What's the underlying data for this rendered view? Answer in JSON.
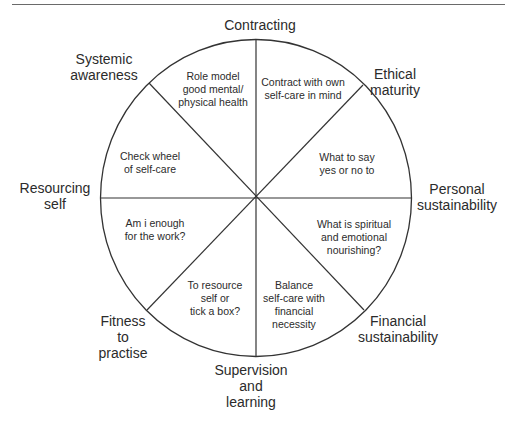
{
  "diagram": {
    "type": "wheel",
    "segment_count": 8,
    "stroke_color": "#333333",
    "background_color": "#ffffff",
    "outer_labels": {
      "contracting": [
        "Contracting"
      ],
      "ethical_maturity": [
        "Ethical",
        "maturity"
      ],
      "personal_sustainability": [
        "Personal",
        "sustainability"
      ],
      "financial_sustainability": [
        "Financial",
        "sustainability"
      ],
      "supervision_and_learning": [
        "Supervision",
        "and",
        "learning"
      ],
      "fitness_to_practise": [
        "Fitness",
        "to",
        "practise"
      ],
      "resourcing_self": [
        "Resourcing",
        "self"
      ],
      "systemic_awareness": [
        "Systemic",
        "awareness"
      ]
    },
    "segments": {
      "top_left": [
        "Role model",
        "good mental/",
        "physical health"
      ],
      "top_right": [
        "Contract with own",
        "self-care in mind"
      ],
      "upper_right": [
        "What to say",
        "yes or no to"
      ],
      "lower_right": [
        "What is spiritual",
        "and emotional",
        "nourishing?"
      ],
      "bottom_right": [
        "Balance",
        "self-care with",
        "financial",
        "necessity"
      ],
      "bottom_left": [
        "To resource",
        "self or",
        "tick a box?"
      ],
      "lower_left": [
        "Am i enough",
        "for the work?"
      ],
      "upper_left": [
        "Check wheel",
        "of self-care"
      ]
    }
  }
}
